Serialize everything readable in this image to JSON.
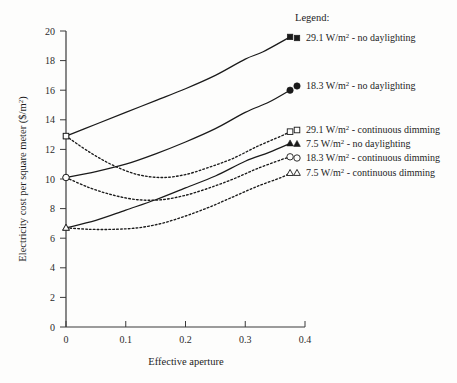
{
  "chart_data": {
    "type": "line",
    "title": "",
    "xlabel": "Effective aperture",
    "ylabel": "Electricity cost per square meter ($/m2)",
    "ylabel_display": "Electricity cost per square meter ($/m",
    "ylabel_exponent": "2",
    "ylabel_tail": ")",
    "xlim": [
      0,
      0.4
    ],
    "ylim": [
      0,
      20
    ],
    "xticks": [
      0,
      0.1,
      0.2,
      0.3,
      0.4
    ],
    "xtick_labels": [
      "0",
      "0.1",
      "0.2",
      "0.3",
      "0.4"
    ],
    "yticks": [
      0,
      2,
      4,
      6,
      8,
      10,
      12,
      14,
      16,
      18,
      20
    ],
    "ytick_labels": [
      "0",
      "2",
      "4",
      "6",
      "8",
      "10",
      "12",
      "14",
      "16",
      "18",
      "20"
    ],
    "grid": false,
    "legend_position": "right",
    "series": [
      {
        "name": "29.1 W/m2 - no daylighting",
        "power": "29.1",
        "unit": "W/m",
        "unit_exponent": "2",
        "condition": "no daylighting",
        "marker": "filled-square",
        "line_style": "solid",
        "color": "#1a1a1a",
        "x": [
          0.0,
          0.05,
          0.1,
          0.15,
          0.2,
          0.25,
          0.3,
          0.33,
          0.375
        ],
        "y": [
          12.9,
          13.7,
          14.5,
          15.3,
          16.1,
          17.0,
          18.1,
          18.6,
          19.6
        ]
      },
      {
        "name": "18.3 W/m2 - no daylighting",
        "power": "18.3",
        "unit": "W/m",
        "unit_exponent": "2",
        "condition": "no daylighting",
        "marker": "filled-circle",
        "line_style": "solid",
        "color": "#1a1a1a",
        "x": [
          0.0,
          0.05,
          0.1,
          0.15,
          0.2,
          0.25,
          0.3,
          0.34,
          0.375
        ],
        "y": [
          10.1,
          10.5,
          11.0,
          11.7,
          12.5,
          13.4,
          14.5,
          15.2,
          16.0
        ]
      },
      {
        "name": "29.1 W/m2 - continuous dimming",
        "power": "29.1",
        "unit": "W/m",
        "unit_exponent": "2",
        "condition": "continuous dimming",
        "marker": "open-square",
        "line_style": "dashed",
        "color": "#1a1a1a",
        "x": [
          0.0,
          0.04,
          0.08,
          0.12,
          0.16,
          0.2,
          0.24,
          0.28,
          0.32,
          0.36,
          0.375
        ],
        "y": [
          12.9,
          11.8,
          10.9,
          10.3,
          10.1,
          10.3,
          10.8,
          11.4,
          12.2,
          12.9,
          13.2
        ]
      },
      {
        "name": "7.5 W/m2 - no daylighting",
        "power": "7.5",
        "unit": "W/m",
        "unit_exponent": "2",
        "condition": "no daylighting",
        "marker": "filled-triangle",
        "line_style": "solid",
        "color": "#1a1a1a",
        "x": [
          0.0,
          0.05,
          0.1,
          0.15,
          0.2,
          0.25,
          0.3,
          0.34,
          0.375
        ],
        "y": [
          6.7,
          7.2,
          7.9,
          8.6,
          9.4,
          10.2,
          11.2,
          11.8,
          12.4
        ]
      },
      {
        "name": "18.3 W/m2 - continuous dimming",
        "power": "18.3",
        "unit": "W/m",
        "unit_exponent": "2",
        "condition": "continuous dimming",
        "marker": "open-circle",
        "line_style": "dashed",
        "color": "#1a1a1a",
        "x": [
          0.0,
          0.04,
          0.08,
          0.12,
          0.16,
          0.2,
          0.24,
          0.28,
          0.32,
          0.36,
          0.375
        ],
        "y": [
          10.1,
          9.4,
          8.9,
          8.6,
          8.6,
          8.9,
          9.4,
          10.0,
          10.7,
          11.3,
          11.5
        ]
      },
      {
        "name": "7.5 W/m2 - continuous dimming",
        "power": "7.5",
        "unit": "W/m",
        "unit_exponent": "2",
        "condition": "continuous dimming",
        "marker": "open-triangle",
        "line_style": "dashed",
        "color": "#1a1a1a",
        "x": [
          0.0,
          0.04,
          0.08,
          0.12,
          0.16,
          0.2,
          0.24,
          0.28,
          0.32,
          0.36,
          0.375
        ],
        "y": [
          6.7,
          6.6,
          6.6,
          6.7,
          7.0,
          7.5,
          8.1,
          8.8,
          9.5,
          10.1,
          10.4
        ]
      }
    ]
  },
  "legend": {
    "heading": "Legend:",
    "entries": [
      {
        "label": "29.1 W/m",
        "exponent": "2",
        "tail": " - no daylighting",
        "marker": "filled-square"
      },
      {
        "label": "18.3 W/m",
        "exponent": "2",
        "tail": " - no daylighting",
        "marker": "filled-circle"
      },
      {
        "label": "29.1 W/m",
        "exponent": "2",
        "tail": " - continuous dimming",
        "marker": "open-square"
      },
      {
        "label": "7.5 W/m",
        "exponent": "2",
        "tail": " - no daylighting",
        "marker": "filled-triangle"
      },
      {
        "label": "18.3 W/m",
        "exponent": "2",
        "tail": " - continuous dimming",
        "marker": "open-circle"
      },
      {
        "label": "7.5 W/m",
        "exponent": "2",
        "tail": " - continuous dimming",
        "marker": "open-triangle"
      }
    ]
  },
  "colors": {
    "axis": "#3a3a3a",
    "line": "#1a1a1a",
    "text": "#1e1e1e",
    "background": "#fdfdfc"
  }
}
